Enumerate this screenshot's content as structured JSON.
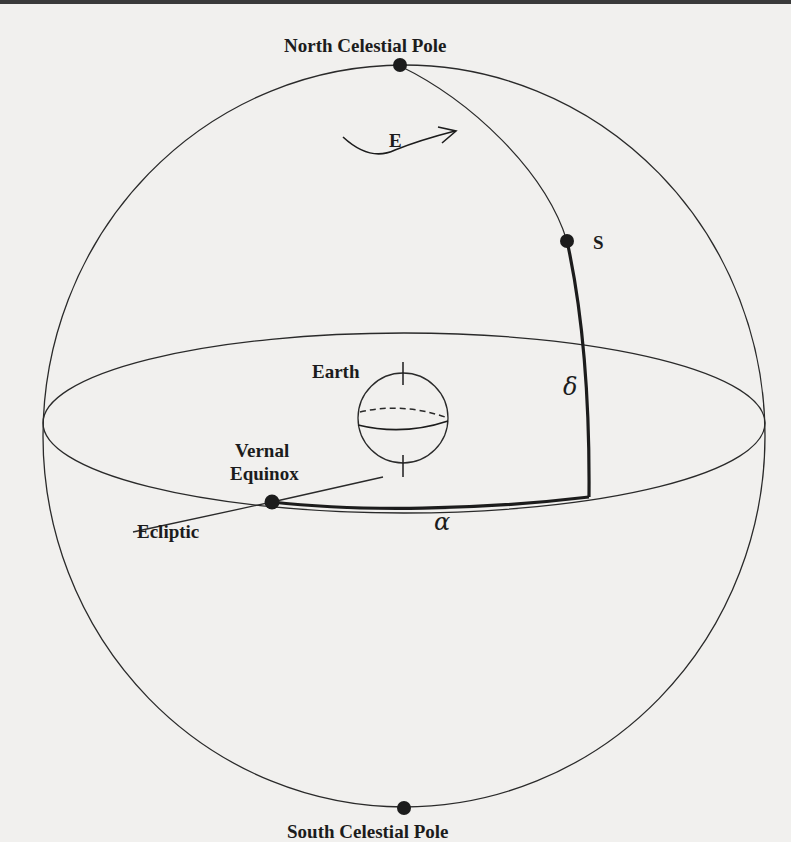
{
  "figure": {
    "labels": {
      "north_pole": "North Celestial Pole",
      "south_pole": "South Celestial Pole",
      "east": "E",
      "star": "S",
      "earth": "Earth",
      "vernal_equinox_line1": "Vernal",
      "vernal_equinox_line2": "Equinox",
      "ecliptic": "Ecliptic",
      "declination": "δ",
      "right_ascension": "α"
    },
    "colors": {
      "ink": "#1c1c1c",
      "paper": "#f1f0ee"
    }
  }
}
